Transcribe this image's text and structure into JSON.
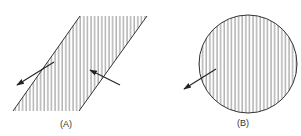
{
  "figure": {
    "panels": [
      {
        "id": "A",
        "label": "(A)",
        "shape": "parallelogram",
        "fill": "vertical-hatching",
        "arrows": [
          {
            "direction": "outward-left-down",
            "crosses_boundary": "left edge"
          },
          {
            "direction": "inward-left-up",
            "crosses_boundary": "right edge"
          }
        ]
      },
      {
        "id": "B",
        "label": "(B)",
        "shape": "circle",
        "fill": "vertical-hatching",
        "arrows": [
          {
            "direction": "outward-left-down",
            "crosses_boundary": "left edge"
          }
        ]
      }
    ],
    "colors": {
      "line": "#333333",
      "hatch": "#666666",
      "background": "#ffffff"
    }
  }
}
